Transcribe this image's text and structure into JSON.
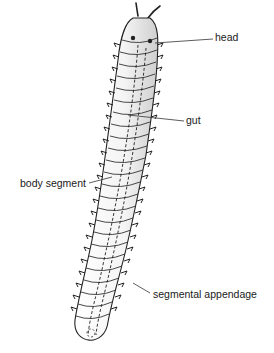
{
  "diagram": {
    "labels": [
      {
        "id": "head",
        "text": "head",
        "x": 215,
        "y": 37
      },
      {
        "id": "gut",
        "text": "gut",
        "x": 186,
        "y": 117
      },
      {
        "id": "body-segment",
        "text": "body segment",
        "x": 20,
        "y": 180
      },
      {
        "id": "segmental-appendage",
        "text": "segmental appendage",
        "x": 153,
        "y": 291
      }
    ],
    "colors": {
      "line": "#222222",
      "background": "#ffffff",
      "shade": "#d8d8d8"
    }
  }
}
